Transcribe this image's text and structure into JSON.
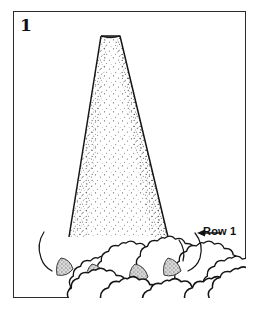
{
  "figure": {
    "step_number": "1",
    "callout_label": "Row 1",
    "callout_arrow": "left-arrow-icon",
    "frame_color": "#2b2b2b",
    "background_color": "#ffffff",
    "line_color": "#1a1a1a",
    "cone_fill_color": "#ffffff",
    "cone_stipple_color": "#555555",
    "ball_fill_color": "#ffffff",
    "shadow_fill_color": "#b8b8b8"
  },
  "diagram": {
    "type": "craft-instruction",
    "subject_shapes": [
      {
        "name": "cone",
        "description": "truncated stippled cone standing upright"
      },
      {
        "name": "ball-ring",
        "description": "ring of fuzzy cotton balls around cone base"
      },
      {
        "name": "shadow-wedges",
        "description": "gray stippled triangular shadows between front balls"
      }
    ],
    "ball_count": 10,
    "shadow_count": 4
  }
}
